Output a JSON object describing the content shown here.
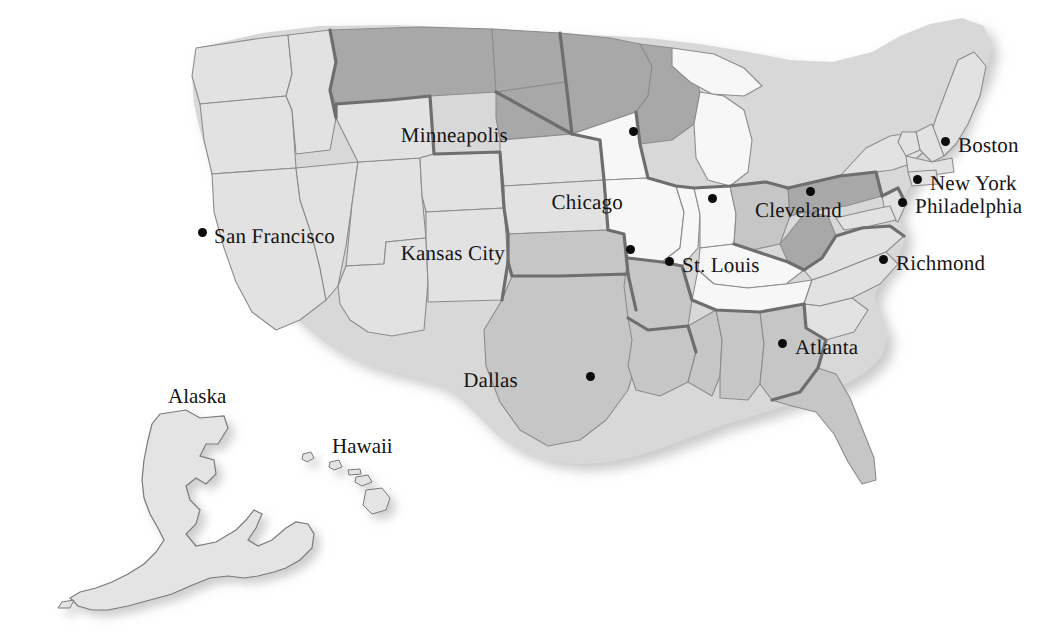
{
  "map": {
    "kind": "choropleth-outline-map",
    "region": "United States of America",
    "background_color": "#ffffff",
    "border_color": "#6e6e6e",
    "inner_border_color": "#8c8c8c",
    "shading": {
      "light": "#e2e2e2",
      "medium": "#c6c6c6",
      "dark": "#a8a8a8",
      "white": "#f7f7f7"
    },
    "dot_color": "#0b0b0b",
    "label_color": "#141414",
    "drop_shadow_color": "#bdbdbd"
  },
  "cities": [
    {
      "name": "Minneapolis",
      "label_side": "left",
      "label_x": 508,
      "label_y": 125,
      "dot_x": 633,
      "dot_y": 131
    },
    {
      "name": "Boston",
      "label_side": "right",
      "label_x": 958,
      "label_y": 135,
      "dot_x": 945,
      "dot_y": 141
    },
    {
      "name": "Chicago",
      "label_side": "left",
      "label_x": 623,
      "label_y": 192,
      "dot_x": 712,
      "dot_y": 198
    },
    {
      "name": "New York",
      "label_side": "right",
      "label_x": 930,
      "label_y": 173,
      "dot_x": 917,
      "dot_y": 179
    },
    {
      "name": "Cleveland",
      "label_side": "below",
      "label_x": 755,
      "label_y": 200,
      "dot_x": 810,
      "dot_y": 191
    },
    {
      "name": "Philadelphia",
      "label_side": "right",
      "label_x": 915,
      "label_y": 196,
      "dot_x": 902,
      "dot_y": 202
    },
    {
      "name": "San Francisco",
      "label_side": "right",
      "label_x": 214,
      "label_y": 226,
      "dot_x": 202,
      "dot_y": 232
    },
    {
      "name": "Kansas City",
      "label_side": "left",
      "label_x": 505,
      "label_y": 243,
      "dot_x": 630,
      "dot_y": 249
    },
    {
      "name": "St. Louis",
      "label_side": "right",
      "label_x": 682,
      "label_y": 255,
      "dot_x": 669,
      "dot_y": 261
    },
    {
      "name": "Richmond",
      "label_side": "right",
      "label_x": 896,
      "label_y": 253,
      "dot_x": 883,
      "dot_y": 259
    },
    {
      "name": "Atlanta",
      "label_side": "right",
      "label_x": 795,
      "label_y": 337,
      "dot_x": 782,
      "dot_y": 343
    },
    {
      "name": "Dallas",
      "label_side": "left",
      "label_x": 518,
      "label_y": 370,
      "dot_x": 590,
      "dot_y": 376
    }
  ],
  "insets": [
    {
      "name": "Alaska",
      "label_x": 168,
      "label_y": 386
    },
    {
      "name": "Hawaii",
      "label_x": 332,
      "label_y": 436
    }
  ]
}
